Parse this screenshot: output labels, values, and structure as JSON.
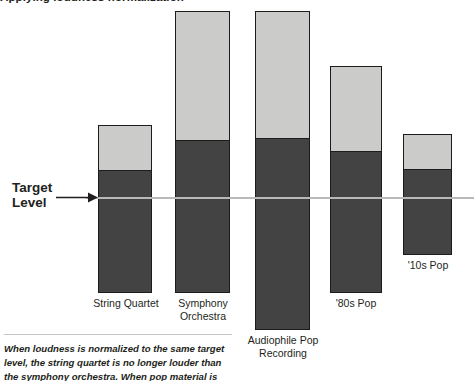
{
  "figure": {
    "clipped_heading": "Applying loudness normalization",
    "target_label": "Target\nLevel",
    "arrow_icon": "arrow-right-icon",
    "caption": "When loudness is normalized to the same target level, the string quartet is no longer louder than the symphony orchestra. When pop material is loudness"
  },
  "colors": {
    "segment_top": "#cbcbc9",
    "segment_bottom": "#434343",
    "bar_border": "#1c1c1c",
    "target_line": "#b9b9b9",
    "text": "#231f20",
    "rule": "#c4c4c4",
    "background": "#ffffff"
  },
  "chart_data": {
    "type": "bar",
    "title": "",
    "subtitle": "",
    "xlabel": "",
    "ylabel": "",
    "grid": false,
    "legend_position": "none",
    "stacked": true,
    "annotations": [
      {
        "name": "target-level",
        "label": "Target Level",
        "y_px": 197,
        "style": "horizontal guide line with left arrow"
      }
    ],
    "categories": [
      "String Quartet",
      "Symphony\nOrchestra",
      "Audiophile Pop\nRecording",
      "'80s Pop",
      "'10s Pop"
    ],
    "series": [
      {
        "name": "Peak headroom (above average level)",
        "color": "#cbcbc9",
        "values": [
          47,
          131,
          129,
          87,
          37
        ]
      },
      {
        "name": "Average loudness (below peak)",
        "color": "#434343",
        "values": [
          121,
          151,
          190,
          140,
          84
        ]
      }
    ],
    "bars": [
      {
        "category": "String Quartet",
        "x": 98,
        "width": 54,
        "top": 125,
        "bottom": 293,
        "split": 172,
        "label_x": 90,
        "label_y": 297,
        "label_width": 72
      },
      {
        "category": "Symphony\nOrchestra",
        "x": 175,
        "width": 55,
        "top": 11,
        "bottom": 293,
        "split": 142,
        "label_x": 168,
        "label_y": 297,
        "label_width": 70
      },
      {
        "category": "Audiophile Pop\nRecording",
        "x": 255,
        "width": 55,
        "top": 11,
        "bottom": 330,
        "split": 140,
        "label_x": 240,
        "label_y": 334,
        "label_width": 86
      },
      {
        "category": "'80s Pop",
        "x": 330,
        "width": 52,
        "top": 66,
        "bottom": 293,
        "split": 153,
        "label_x": 322,
        "label_y": 297,
        "label_width": 68
      },
      {
        "category": "'10s Pop",
        "x": 403,
        "width": 49,
        "top": 134,
        "bottom": 255,
        "split": 171,
        "label_x": 394,
        "label_y": 259,
        "label_width": 68
      }
    ],
    "target_line": {
      "y": 197,
      "x_start": 86,
      "x_end": 474
    }
  }
}
